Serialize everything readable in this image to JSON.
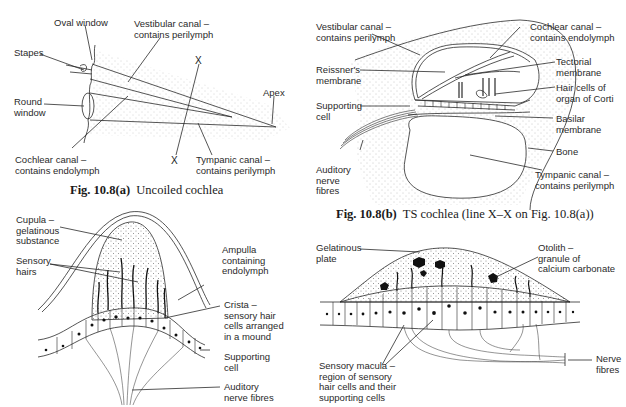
{
  "figures": {
    "a": {
      "caption_num": "Fig. 10.8(a)",
      "caption_text": "Uncoiled cochlea",
      "labels": {
        "oval_window": "Oval window",
        "vestibular_canal": "Vestibular canal –\ncontains perilymph",
        "stapes": "Stapes",
        "round_window": "Round\nwindow",
        "apex": "Apex",
        "cochlear_canal": "Cochlear canal –\ncontains endolymph",
        "tympanic_canal": "Tympanic canal –\ncontains perilymph",
        "x_top": "X",
        "x_bottom": "X"
      }
    },
    "b": {
      "caption_num": "Fig. 10.8(b)",
      "caption_text": "TS cochlea (line X–X on Fig. 10.8(a))",
      "labels": {
        "vestibular_canal": "Vestibular canal –\ncontains perilymph",
        "cochlear_canal": "Cochlear canal –\ncontains endolymph",
        "reissners_membrane": "Reissner's\nmembrane",
        "tectorial_membrane": "Tectorial\nmembrane",
        "hair_cells": "Hair cells of\norgan of Corti",
        "supporting_cell": "Supporting\ncell",
        "basilar_membrane": "Basilar\nmembrane",
        "bone": "Bone",
        "auditory_nerve": "Auditory\nnerve\nfibres",
        "tympanic_canal": "Tympanic canal –\ncontains perilymph"
      }
    },
    "c": {
      "labels": {
        "cupula": "Cupula –\ngelatinous\nsubstance",
        "sensory_hairs": "Sensory\nhairs",
        "ampulla": "Ampulla\ncontaining\nendolymph",
        "crista": "Crista –\nsensory hair\ncells arranged\nin a mound",
        "supporting_cell": "Supporting\ncell",
        "auditory_nerve": "Auditory\nnerve fibres"
      }
    },
    "d": {
      "labels": {
        "gelatinous_plate": "Gelatinous\nplate",
        "otolith": "Otolith –\ngranule of\ncalcium carbonate",
        "sensory_macula": "Sensory macula –\nregion of sensory\nhair cells and their\nsupporting cells",
        "nerve_fibres": "Nerve\nfibres"
      }
    }
  },
  "colors": {
    "ink": "#2a2a2a",
    "stipple": "#9a9a9a",
    "background": "#ffffff"
  }
}
